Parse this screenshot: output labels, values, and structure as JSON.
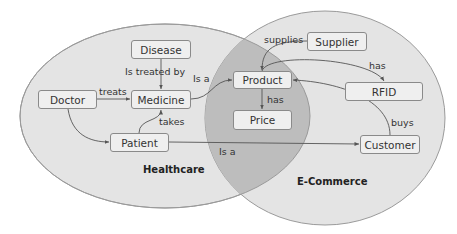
{
  "colors": {
    "ellipse_fill": "#e4e4e4",
    "intersection_fill": "#bdbdbd",
    "ellipse_stroke": "#9a9a9a",
    "node_fill": "#efefef",
    "node_stroke": "#8a8a8a",
    "edge": "#555555"
  },
  "regions": {
    "healthcare": "Healthcare",
    "ecommerce": "E-Commerce"
  },
  "nodes": {
    "disease": "Disease",
    "doctor": "Doctor",
    "medicine": "Medicine",
    "patient": "Patient",
    "product": "Product",
    "price": "Price",
    "supplier": "Supplier",
    "rfid": "RFID",
    "customer": "Customer"
  },
  "edges": {
    "disease_medicine": "Is treated by",
    "doctor_medicine": "treats",
    "medicine_product": "Is a",
    "patient_medicine": "takes",
    "patient_customer": "Is a",
    "supplier_product": "supplies",
    "product_rfid": "has",
    "product_price": "has",
    "customer_product": "buys"
  }
}
